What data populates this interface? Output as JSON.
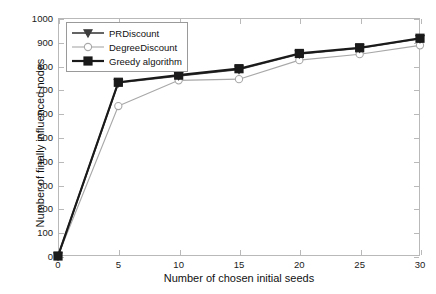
{
  "chart_data": {
    "type": "line",
    "title": "",
    "xlabel": "Number of chosen initial seeds",
    "ylabel": "Number of finally influenced nodes",
    "x": [
      0,
      5,
      10,
      15,
      20,
      25,
      30
    ],
    "xlim": [
      0,
      30
    ],
    "ylim": [
      0,
      1000
    ],
    "xticks": [
      "0",
      "5",
      "10",
      "15",
      "20",
      "25",
      "30"
    ],
    "yticks": [
      "0",
      "100",
      "200",
      "300",
      "400",
      "500",
      "600",
      "700",
      "800",
      "900",
      "1000"
    ],
    "grid": false,
    "legend_position": "upper-left",
    "series": [
      {
        "name": "PRDiscount",
        "marker": "triangle-down",
        "color": "#3d3d3d",
        "values": [
          0,
          728,
          757,
          784,
          849,
          873,
          913
        ]
      },
      {
        "name": "DegreeDiscount",
        "marker": "circle",
        "color": "#a8a8a8",
        "values": [
          0,
          630,
          738,
          743,
          823,
          848,
          885
        ]
      },
      {
        "name": "Greedy algorithm",
        "marker": "square",
        "color": "#1a1a1a",
        "values": [
          0,
          730,
          760,
          787,
          851,
          875,
          915
        ]
      }
    ]
  },
  "legend": {
    "items": [
      {
        "label": "PRDiscount"
      },
      {
        "label": "DegreeDiscount"
      },
      {
        "label": "Greedy algorithm"
      }
    ]
  }
}
